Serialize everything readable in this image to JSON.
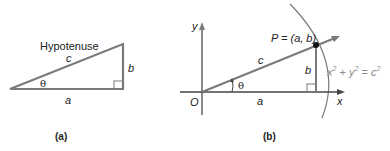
{
  "panel_a": {
    "hypotenuse_label": "Hypotenuse",
    "side_c": "c",
    "side_b": "b",
    "side_a": "a",
    "angle": "θ",
    "caption": "(a)"
  },
  "panel_b": {
    "y_axis": "y",
    "x_axis": "x",
    "origin": "O",
    "point_label": "P = (a, b)",
    "side_c": "c",
    "side_b": "b",
    "side_a": "a",
    "angle": "θ",
    "circle_eq_x": "x",
    "circle_eq_plus": " + ",
    "circle_eq_y": "y",
    "circle_eq_eq": " = ",
    "circle_eq_c": "c",
    "sup": "2",
    "caption": "(b)"
  },
  "colors": {
    "line": "#7a7a7a",
    "text": "#222222",
    "equation": "#8a8a8a"
  }
}
